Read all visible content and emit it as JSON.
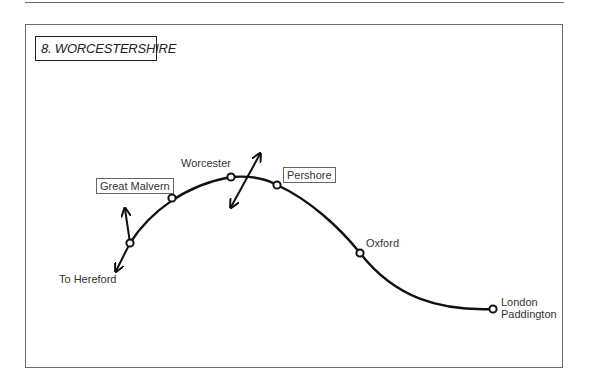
{
  "title": "8. WORCESTERSHIRE",
  "stations": [
    {
      "name": "Great Malvern",
      "boxed": true
    },
    {
      "name": "Worcester",
      "boxed": false
    },
    {
      "name": "Pershore",
      "boxed": true
    },
    {
      "name": "Oxford",
      "boxed": false
    },
    {
      "name": "London",
      "line2": "Paddington",
      "boxed": false
    }
  ],
  "direction_labels": {
    "hereford": "To Hereford"
  },
  "colors": {
    "line": "#111111",
    "frame": "#6a6a6a"
  }
}
